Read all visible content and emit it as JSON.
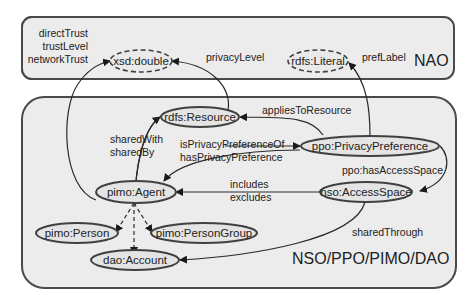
{
  "diagram": {
    "groups": [
      {
        "id": "nao",
        "label": "NAO"
      },
      {
        "id": "nso",
        "label": "NSO/PPO/PIMO/DAO"
      }
    ],
    "nodes": {
      "xsd_double": "xsd:double",
      "rdfs_literal": "rdfs:Literal",
      "rdfs_resource": "rdfs:Resource",
      "ppo_privacy_preference": "ppo:PrivacyPreference",
      "pimo_agent": "pimo:Agent",
      "nso_access_space": "nso:AccessSpace",
      "pimo_person": "pimo:Person",
      "pimo_person_group": "pimo:PersonGroup",
      "dao_account": "dao:Account"
    },
    "edges": {
      "direct_trust": "directTrust",
      "trust_level": "trustLevel",
      "network_trust": "networkTrust",
      "privacy_level": "privacyLevel",
      "pref_label": "prefLabel",
      "applies_to_resource": "appliesToResource",
      "shared_with": "sharedWith",
      "shared_by": "sharedBy",
      "is_privacy_preference_of": "isPrivacyPreferenceOf",
      "has_privacy_preference": "hasPrivacyPreference",
      "has_access_space": "ppo:hasAccessSpace",
      "includes": "includes",
      "excludes": "excludes",
      "shared_through": "sharedThrough"
    }
  }
}
